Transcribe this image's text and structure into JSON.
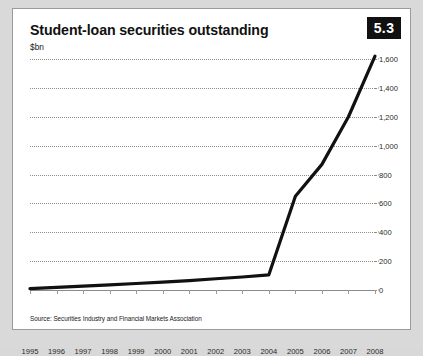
{
  "figure": {
    "number": "5.3",
    "title": "Student-loan securities outstanding",
    "unit": "$bn",
    "source": "Source: Securities Industry and Financial Markets Association"
  },
  "chart_data": {
    "type": "line",
    "title": "Student-loan securities outstanding",
    "xlabel": "",
    "ylabel": "$bn",
    "ylim": [
      0,
      1600
    ],
    "yticks": [
      "0",
      "200",
      "400",
      "600",
      "800",
      "1,000",
      "1,200",
      "1,400",
      "1,600"
    ],
    "ytick_values": [
      0,
      200,
      400,
      600,
      800,
      1000,
      1200,
      1400,
      1600
    ],
    "grid": true,
    "legend": "none",
    "categories": [
      "1995",
      "1996",
      "1997",
      "1998",
      "1999",
      "2000",
      "2001",
      "2002",
      "2003",
      "2004",
      "2005",
      "2006",
      "2007",
      "2008"
    ],
    "series": [
      {
        "name": "Student-loan securities outstanding",
        "color": "#111111",
        "values": [
          10,
          18,
          27,
          36,
          45,
          55,
          65,
          78,
          90,
          105,
          650,
          870,
          1200,
          1620
        ]
      }
    ]
  }
}
